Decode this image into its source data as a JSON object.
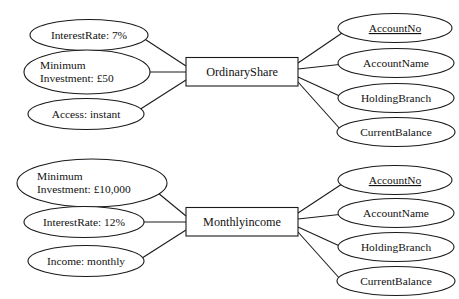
{
  "diagram": {
    "type": "entity-relationship",
    "background_color": "#ffffff",
    "line_color": "#1a1a1a",
    "text_color": "#111111",
    "groups": [
      {
        "id": "ordinary-share",
        "entity": "OrdinaryShare",
        "left_attributes": [
          {
            "id": "os-interest-rate",
            "lines": [
              "InterestRate: 7%"
            ],
            "align": "center",
            "primary_key": false
          },
          {
            "id": "os-minimum-investment",
            "lines": [
              "Minimum",
              "Investment: £50"
            ],
            "align": "left",
            "primary_key": false
          },
          {
            "id": "os-access",
            "lines": [
              "Access: instant"
            ],
            "align": "center",
            "primary_key": false
          }
        ],
        "right_attributes": [
          {
            "id": "os-account-no",
            "lines": [
              "AccountNo"
            ],
            "align": "center",
            "primary_key": true
          },
          {
            "id": "os-account-name",
            "lines": [
              "AccountName"
            ],
            "align": "center",
            "primary_key": false
          },
          {
            "id": "os-holding-branch",
            "lines": [
              "HoldingBranch"
            ],
            "align": "center",
            "primary_key": false
          },
          {
            "id": "os-current-balance",
            "lines": [
              "CurrentBalance"
            ],
            "align": "center",
            "primary_key": false
          }
        ]
      },
      {
        "id": "monthly-income",
        "entity": "Monthlyincome",
        "left_attributes": [
          {
            "id": "mi-minimum-investment",
            "lines": [
              "Minimum",
              "Investment: £10,000"
            ],
            "align": "left",
            "primary_key": false
          },
          {
            "id": "mi-interest-rate",
            "lines": [
              "InterestRate: 12%"
            ],
            "align": "center",
            "primary_key": false
          },
          {
            "id": "mi-income",
            "lines": [
              "Income: monthly"
            ],
            "align": "center",
            "primary_key": false
          }
        ],
        "right_attributes": [
          {
            "id": "mi-account-no",
            "lines": [
              "AccountNo"
            ],
            "align": "center",
            "primary_key": true
          },
          {
            "id": "mi-account-name",
            "lines": [
              "AccountName"
            ],
            "align": "center",
            "primary_key": false
          },
          {
            "id": "mi-holding-branch",
            "lines": [
              "HoldingBranch"
            ],
            "align": "center",
            "primary_key": false
          },
          {
            "id": "mi-current-balance",
            "lines": [
              "CurrentBalance"
            ],
            "align": "center",
            "primary_key": false
          }
        ]
      }
    ]
  }
}
